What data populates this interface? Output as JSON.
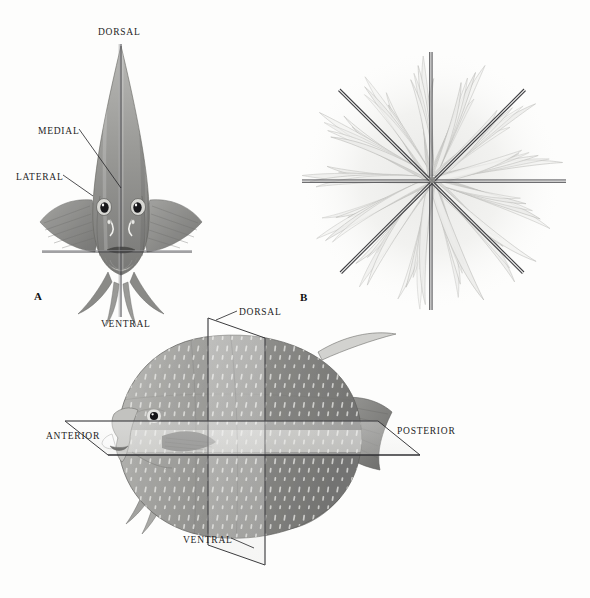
{
  "figure": {
    "background_color": "#fdfdfc",
    "ink_color": "#1d1d1f"
  },
  "panels": [
    {
      "letter": "A",
      "name": "panel-a-fish-frontal",
      "subject": "angelfish-frontal-view",
      "symmetry": "bilateral",
      "letter_pos": {
        "x": 34,
        "y": 290
      },
      "labels": [
        {
          "text": "DORSAL",
          "name": "label-dorsal-a",
          "x": 98,
          "y": 27,
          "align": "left"
        },
        {
          "text": "MEDIAL",
          "name": "label-medial-a",
          "x": 38,
          "y": 126,
          "align": "left"
        },
        {
          "text": "LATERAL",
          "name": "label-lateral-a",
          "x": 16,
          "y": 172,
          "align": "left"
        },
        {
          "text": "VENTRAL",
          "name": "label-ventral-a",
          "x": 101,
          "y": 319,
          "align": "left"
        }
      ],
      "axes": [
        {
          "name": "median-sagittal-axis",
          "orientation": "vertical",
          "x1": 121,
          "y1": 44,
          "x2": 121,
          "y2": 317
        },
        {
          "name": "transverse-axis",
          "orientation": "horizontal",
          "x1": 42,
          "y1": 252,
          "x2": 192,
          "y2": 252
        }
      ],
      "leaders": [
        {
          "name": "leader-medial",
          "x1": 78,
          "y1": 130,
          "x2": 120,
          "y2": 186
        },
        {
          "name": "leader-lateral",
          "x1": 62,
          "y1": 176,
          "x2": 92,
          "y2": 196
        }
      ]
    },
    {
      "letter": "B",
      "name": "panel-b-anemone-oral",
      "subject": "sea-anemone-oral-view",
      "symmetry": "radial",
      "letter_pos": {
        "x": 300,
        "y": 291
      },
      "labels": [],
      "center": {
        "x": 432,
        "y": 180
      },
      "axis_count": 4,
      "ray_count": 8,
      "axes": [
        {
          "name": "radial-axis-vertical",
          "angle_deg": 90,
          "half_length": 130
        },
        {
          "name": "radial-axis-horizontal",
          "angle_deg": 0,
          "half_length": 135
        },
        {
          "name": "radial-axis-diagonal-ne",
          "angle_deg": 45,
          "half_length": 130
        },
        {
          "name": "radial-axis-diagonal-nw",
          "angle_deg": 135,
          "half_length": 130
        }
      ]
    },
    {
      "letter": "C",
      "name": "panel-c-fish-lateral",
      "subject": "angelfish-lateral-view-with-planes",
      "symmetry": "bilateral",
      "letter_pos": null,
      "labels": [
        {
          "text": "DORSAL",
          "name": "label-dorsal-c",
          "x": 239,
          "y": 307,
          "align": "left"
        },
        {
          "text": "ANTERIOR",
          "name": "label-anterior-c",
          "x": 46,
          "y": 431,
          "align": "left"
        },
        {
          "text": "POSTERIOR",
          "name": "label-posterior-c",
          "x": 397,
          "y": 426,
          "align": "left"
        },
        {
          "text": "VENTRAL",
          "name": "label-ventral-c",
          "x": 183,
          "y": 535,
          "align": "left"
        }
      ],
      "planes": [
        {
          "name": "transverse-plane",
          "orientation": "vertical"
        },
        {
          "name": "frontal-plane",
          "orientation": "horizontal"
        }
      ],
      "leaders": [
        {
          "name": "leader-dorsal-c",
          "x1": 236,
          "y1": 311,
          "x2": 217,
          "y2": 318
        },
        {
          "name": "leader-ventral-c",
          "x1": 229,
          "y1": 538,
          "x2": 252,
          "y2": 545
        }
      ]
    }
  ]
}
